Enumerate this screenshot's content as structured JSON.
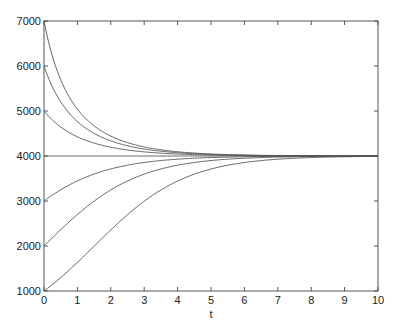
{
  "chart_data": {
    "type": "line",
    "title": "",
    "xlabel": "t",
    "ylabel": "",
    "xlim": [
      0,
      10
    ],
    "ylim": [
      1000,
      7000
    ],
    "xticks": [
      0,
      1,
      2,
      3,
      4,
      5,
      6,
      7,
      8,
      9,
      10
    ],
    "yticks": [
      1000,
      2000,
      3000,
      4000,
      5000,
      6000,
      7000
    ],
    "grid": false,
    "legend": null,
    "model": "logistic P(t) = 4000 / (1 + (4000/P0 - 1) e^(-0.73 t))",
    "carrying_capacity": 4000,
    "rate": 0.73,
    "x": [
      0,
      0.5,
      1,
      1.5,
      2,
      2.5,
      3,
      3.5,
      4,
      5,
      6,
      7,
      8,
      9,
      10
    ],
    "series": [
      {
        "name": "P0=1000",
        "initial": 1000
      },
      {
        "name": "P0=2000",
        "initial": 2000
      },
      {
        "name": "P0=3000",
        "initial": 3000
      },
      {
        "name": "P0=4000",
        "initial": 4000
      },
      {
        "name": "P0=5000",
        "initial": 5000
      },
      {
        "name": "P0=6000",
        "initial": 6000
      },
      {
        "name": "P0=7000",
        "initial": 7000
      }
    ],
    "line_color": "#555555"
  }
}
